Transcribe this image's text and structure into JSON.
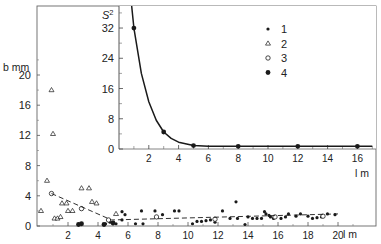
{
  "chart_data": [
    {
      "id": "main",
      "type": "scatter",
      "title": "",
      "xlabel": "l m",
      "ylabel": "b mm",
      "xlim": [
        0,
        22.5
      ],
      "ylim": [
        0,
        22
      ],
      "xticks": [
        2,
        4,
        6,
        8,
        10,
        12,
        14,
        16,
        18,
        20
      ],
      "yticks": [
        0,
        4,
        8,
        12,
        16,
        20
      ],
      "grid": false,
      "series": [
        {
          "name": "1",
          "marker": "small-filled-dot",
          "points": [
            [
              5.6,
              1.9
            ],
            [
              5.8,
              1.5
            ],
            [
              6.9,
              2.0
            ],
            [
              7.8,
              2.0
            ],
            [
              8.3,
              1.5
            ],
            [
              9.1,
              2.0
            ],
            [
              9.4,
              2.0
            ],
            [
              5.6,
              0.8
            ],
            [
              4.5,
              0.3
            ],
            [
              4.8,
              0.5
            ],
            [
              5.2,
              0.3
            ],
            [
              6.5,
              0.3
            ],
            [
              7.0,
              0.3
            ],
            [
              10.3,
              0.3
            ],
            [
              10.6,
              0.6
            ],
            [
              10.9,
              0.6
            ],
            [
              11.2,
              0.7
            ],
            [
              11.5,
              0.8
            ],
            [
              11.8,
              0.5
            ],
            [
              12.3,
              2.0
            ],
            [
              13.2,
              3.2
            ],
            [
              12.8,
              1.0
            ],
            [
              13.3,
              1.0
            ],
            [
              13.8,
              0.2
            ],
            [
              14.0,
              1.2
            ],
            [
              14.3,
              1.0
            ],
            [
              14.6,
              1.0
            ],
            [
              14.9,
              1.0
            ],
            [
              15.1,
              1.9
            ],
            [
              15.2,
              1.6
            ],
            [
              15.4,
              1.4
            ],
            [
              15.5,
              1.2
            ],
            [
              15.7,
              1.0
            ],
            [
              16.2,
              1.0
            ],
            [
              16.5,
              1.2
            ],
            [
              16.7,
              1.6
            ],
            [
              17.2,
              1.3
            ],
            [
              17.5,
              1.6
            ],
            [
              18.0,
              1.3
            ],
            [
              18.3,
              1.0
            ],
            [
              18.6,
              1.1
            ],
            [
              18.9,
              1.2
            ],
            [
              19.3,
              1.6
            ],
            [
              19.8,
              1.5
            ]
          ]
        },
        {
          "name": "2",
          "marker": "open-triangle",
          "points": [
            [
              0.2,
              2.0
            ],
            [
              0.6,
              6.0
            ],
            [
              0.9,
              18.0
            ],
            [
              1.0,
              12.2
            ],
            [
              1.1,
              1.0
            ],
            [
              1.3,
              1.0
            ],
            [
              1.5,
              1.2
            ],
            [
              1.6,
              3.0
            ],
            [
              1.9,
              3.0
            ],
            [
              2.0,
              2.0
            ],
            [
              2.3,
              2.0
            ],
            [
              2.9,
              5.0
            ],
            [
              3.4,
              5.0
            ],
            [
              3.6,
              3.2
            ],
            [
              3.9,
              3.0
            ],
            [
              5.2,
              1.6
            ]
          ]
        },
        {
          "name": "3",
          "marker": "open-circle",
          "points": [
            [
              0.9,
              4.3
            ],
            [
              2.9,
              2.3
            ],
            [
              4.7,
              0.8
            ],
            [
              7.9,
              1.2
            ],
            [
              11.8,
              0.9
            ],
            [
              15.8,
              1.2
            ],
            [
              19.0,
              1.3
            ]
          ]
        },
        {
          "name": "4",
          "marker": "large-filled-dot",
          "points": [
            [
              2.7,
              0.2
            ],
            [
              2.9,
              0.3
            ],
            [
              4.4,
              0.2
            ],
            [
              5.0,
              0.4
            ]
          ]
        },
        {
          "name": "trend-dashed",
          "marker": "dashed-line",
          "points": [
            [
              0.9,
              4.3
            ],
            [
              4.9,
              0.8
            ],
            [
              20.0,
              1.6
            ]
          ]
        }
      ]
    },
    {
      "id": "inset",
      "type": "line",
      "title": "",
      "xlabel": "l m",
      "ylabel": "S2",
      "ylabel_main": "S",
      "ylabel_sup": "2",
      "xlim": [
        0,
        17
      ],
      "ylim": [
        0,
        36
      ],
      "xticks": [
        2,
        4,
        6,
        8,
        10,
        12,
        14,
        16
      ],
      "yticks": [
        0,
        8,
        16,
        24,
        32
      ],
      "grid": false,
      "series": [
        {
          "name": "4",
          "marker": "large-filled-dot",
          "points": [
            [
              1,
              32
            ],
            [
              3,
              4.5
            ],
            [
              5,
              0.9
            ],
            [
              8,
              0.7
            ],
            [
              12,
              0.7
            ],
            [
              16,
              0.7
            ]
          ]
        },
        {
          "name": "fit-curve",
          "marker": "solid-line",
          "points": [
            [
              0.85,
              38
            ],
            [
              1,
              32
            ],
            [
              1.5,
              20
            ],
            [
              2,
              12.5
            ],
            [
              2.5,
              7.6
            ],
            [
              3,
              4.5
            ],
            [
              3.5,
              2.8
            ],
            [
              4,
              1.8
            ],
            [
              5,
              0.9
            ],
            [
              6,
              0.75
            ],
            [
              8,
              0.7
            ],
            [
              12,
              0.7
            ],
            [
              16,
              0.7
            ],
            [
              17,
              0.7
            ]
          ]
        }
      ]
    }
  ],
  "labels": {
    "main_ylabel": "b mm",
    "main_xlabel": "l m",
    "inset_ylabel_base": "S",
    "inset_ylabel_sup": "2",
    "inset_xlabel": "l m",
    "main_xtick_labels": [
      "2",
      "4",
      "6",
      "8",
      "10",
      "12",
      "14",
      "16",
      "18",
      "20"
    ],
    "main_ytick_labels": [
      "0",
      "4",
      "8",
      "12",
      "16",
      "20"
    ],
    "inset_xtick_labels": [
      "2",
      "4",
      "6",
      "8",
      "10",
      "12",
      "14",
      "16"
    ],
    "inset_ytick_labels": [
      "0",
      "8",
      "16",
      "24",
      "32"
    ]
  },
  "legend": {
    "position": "inset-upper-right",
    "items": [
      {
        "marker": "small-filled-dot",
        "label": "1"
      },
      {
        "marker": "open-triangle",
        "label": "2"
      },
      {
        "marker": "open-circle",
        "label": "3"
      },
      {
        "marker": "large-filled-dot",
        "label": "4"
      }
    ]
  },
  "colors": {
    "ink": "#1a1a1a",
    "frame": "#555555",
    "background": "#ffffff"
  }
}
